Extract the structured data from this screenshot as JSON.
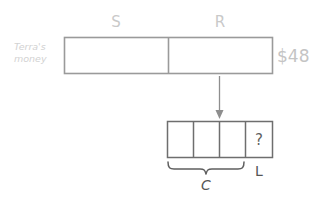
{
  "diagram": {
    "type": "tape-diagram",
    "background_color": "#ffffff",
    "top_bar": {
      "row_label_line1": "Terra's",
      "row_label_line2": "money",
      "total_label": "$48",
      "segments": [
        {
          "label": "S",
          "name": "segment-s"
        },
        {
          "label": "R",
          "name": "segment-r"
        }
      ],
      "label_color": "#c9c9c9",
      "stroke_color": "#9a9a9a"
    },
    "connector": {
      "name": "down-arrow",
      "direction": "down"
    },
    "bottom_bar": {
      "cells": [
        {
          "label": "",
          "name": "cell-1"
        },
        {
          "label": "",
          "name": "cell-2"
        },
        {
          "label": "",
          "name": "cell-3"
        },
        {
          "label": "?",
          "name": "cell-unknown"
        }
      ],
      "stroke_color": "#6e6e6e"
    },
    "braces": [
      {
        "label": "C",
        "name": "brace-c",
        "spans_cells": 3
      },
      {
        "label": "L",
        "name": "brace-l",
        "spans_cells": 1
      }
    ]
  }
}
